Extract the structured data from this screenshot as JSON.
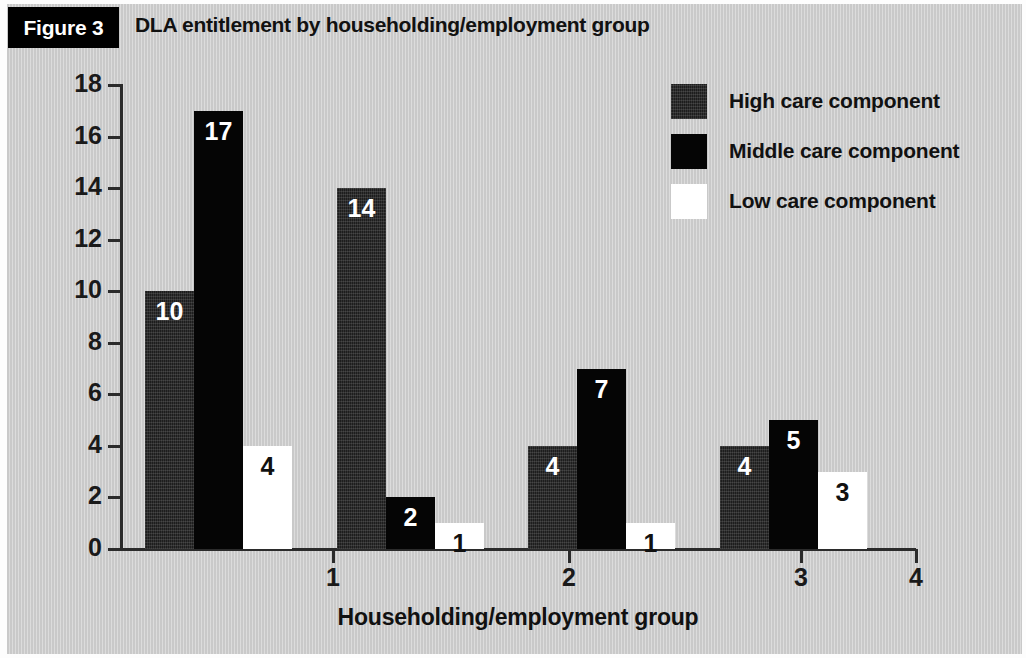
{
  "figure": {
    "badge": "Figure 3",
    "title": "DLA entitlement by householding/employment group"
  },
  "chart_data": {
    "type": "bar",
    "title": "DLA entitlement by householding/employment group",
    "xlabel": "Householding/employment group",
    "ylabel": "",
    "categories": [
      "1",
      "2",
      "3",
      "4"
    ],
    "x_tick_labels": [
      "1",
      "2",
      "3",
      "4"
    ],
    "y_tick_labels": [
      "0",
      "2",
      "4",
      "6",
      "8",
      "10",
      "12",
      "14",
      "16",
      "18"
    ],
    "ylim": [
      0,
      18
    ],
    "xlim": [
      0,
      4
    ],
    "grid": false,
    "legend_position": "top-right",
    "series": [
      {
        "name": "High care component",
        "color": "#1d1d1d",
        "values": [
          10,
          14,
          4,
          4
        ]
      },
      {
        "name": "Middle care component",
        "color": "#050505",
        "values": [
          17,
          2,
          7,
          5
        ]
      },
      {
        "name": "Low care component",
        "color": "#ffffff",
        "values": [
          4,
          1,
          1,
          3
        ]
      }
    ],
    "bar_labels": [
      [
        "10",
        "17",
        "4"
      ],
      [
        "14",
        "2",
        "1"
      ],
      [
        "4",
        "7",
        "1"
      ],
      [
        "4",
        "5",
        "3"
      ]
    ]
  },
  "legend": {
    "items": [
      {
        "label": "High care component",
        "swatch": "high"
      },
      {
        "label": "Middle care component",
        "swatch": "middle"
      },
      {
        "label": "Low care component",
        "swatch": "low"
      }
    ]
  },
  "axes": {
    "x_title": "Householding/employment group",
    "y_ticks": [
      "18",
      "16",
      "14",
      "12",
      "10",
      "8",
      "6",
      "4",
      "2",
      "0"
    ],
    "x_ticks": [
      "1",
      "2",
      "3",
      "4"
    ]
  }
}
